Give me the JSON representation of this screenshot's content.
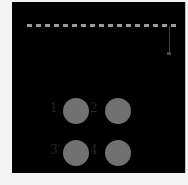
{
  "board": {
    "background": "#000000",
    "dash_color": "#9a9a9a",
    "dash_count": 17
  },
  "buttons": [
    {
      "label": "1",
      "color": "#717171"
    },
    {
      "label": "2",
      "color": "#717171"
    },
    {
      "label": "3",
      "color": "#717171"
    },
    {
      "label": "4",
      "color": "#717171"
    }
  ]
}
